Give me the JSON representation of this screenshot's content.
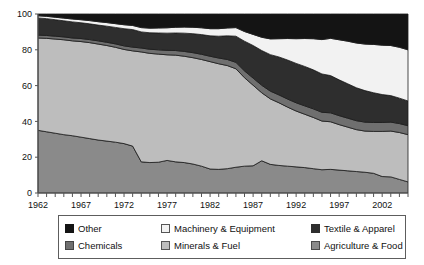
{
  "chart_data": {
    "type": "area",
    "stacked": true,
    "normalized": true,
    "title": "",
    "subtitle": "",
    "xlabel": "",
    "ylabel": "",
    "xlim": [
      1962,
      2005
    ],
    "ylim": [
      0,
      100
    ],
    "grid": false,
    "legend_position": "bottom",
    "y_ticks": [
      0,
      20,
      40,
      60,
      80,
      100
    ],
    "y_tick_labels": [
      "0",
      "20",
      "40",
      "60",
      "80",
      "100"
    ],
    "x_tick_labels": [
      "1962",
      "1967",
      "1972",
      "1977",
      "1982",
      "1987",
      "1992",
      "1997",
      "2002"
    ],
    "x_tick_values": [
      1962,
      1967,
      1972,
      1977,
      1982,
      1987,
      1992,
      1997,
      2002
    ],
    "x_minor_tick_interval": 1,
    "x": [
      1962,
      1963,
      1964,
      1965,
      1966,
      1967,
      1968,
      1969,
      1970,
      1971,
      1972,
      1973,
      1974,
      1975,
      1976,
      1977,
      1978,
      1979,
      1980,
      1981,
      1982,
      1983,
      1984,
      1985,
      1986,
      1987,
      1988,
      1989,
      1990,
      1991,
      1992,
      1993,
      1994,
      1995,
      1996,
      1997,
      1998,
      1999,
      2000,
      2001,
      2002,
      2003,
      2004,
      2005
    ],
    "series": [
      {
        "name": "Agriculture & Food",
        "color": "#8a8a8a",
        "values": [
          35.0,
          34.2,
          33.4,
          32.6,
          32.0,
          31.2,
          30.4,
          29.6,
          29.0,
          28.4,
          27.6,
          26.2,
          17.4,
          17.0,
          17.2,
          18.2,
          17.4,
          17.0,
          16.2,
          15.0,
          13.4,
          13.2,
          13.6,
          14.4,
          15.0,
          15.2,
          18.0,
          16.0,
          15.4,
          15.0,
          14.6,
          14.2,
          13.6,
          13.0,
          13.2,
          12.8,
          12.4,
          12.0,
          11.6,
          11.0,
          9.2,
          9.0,
          7.6,
          6.2
        ]
      },
      {
        "name": "Minerals & Fuel",
        "color": "#bdbdbd",
        "values": [
          51.6,
          52.2,
          52.6,
          53.0,
          53.0,
          53.4,
          53.6,
          53.6,
          53.4,
          53.0,
          52.6,
          53.2,
          61.4,
          61.0,
          60.4,
          59.0,
          59.6,
          59.4,
          59.4,
          59.6,
          60.0,
          59.0,
          57.6,
          55.0,
          49.4,
          45.0,
          38.0,
          36.6,
          35.0,
          33.0,
          31.2,
          29.8,
          28.6,
          27.2,
          26.6,
          25.4,
          24.4,
          23.4,
          23.0,
          23.4,
          25.2,
          25.6,
          26.2,
          26.4
        ]
      },
      {
        "name": "Chemicals",
        "color": "#6f6f6f",
        "values": [
          1.6,
          1.6,
          1.6,
          1.6,
          1.6,
          1.7,
          1.7,
          1.8,
          1.8,
          1.9,
          2.0,
          2.1,
          2.2,
          2.3,
          2.4,
          2.5,
          2.6,
          2.7,
          2.8,
          2.9,
          3.0,
          3.2,
          3.4,
          3.6,
          3.8,
          4.0,
          4.2,
          4.3,
          4.4,
          4.5,
          4.6,
          4.7,
          4.8,
          4.9,
          5.0,
          5.0,
          5.0,
          5.0,
          5.0,
          5.0,
          5.0,
          5.0,
          5.0,
          5.0
        ]
      },
      {
        "name": "Textile & Apparel",
        "color": "#2e2e2e",
        "values": [
          9.6,
          9.4,
          9.2,
          9.0,
          9.0,
          8.8,
          8.8,
          8.8,
          9.0,
          9.2,
          9.6,
          9.8,
          9.0,
          9.2,
          9.4,
          9.6,
          9.8,
          10.2,
          10.6,
          11.0,
          11.4,
          12.2,
          13.2,
          14.6,
          16.6,
          18.2,
          19.4,
          20.4,
          21.2,
          21.8,
          22.0,
          22.0,
          21.8,
          21.4,
          20.8,
          20.0,
          19.2,
          18.4,
          17.6,
          16.6,
          15.6,
          14.8,
          14.2,
          13.8
        ]
      },
      {
        "name": "Machinery & Equipment",
        "color": "#f2f2f2",
        "values": [
          1.2,
          1.3,
          1.4,
          1.5,
          1.6,
          1.7,
          1.8,
          1.9,
          2.0,
          2.1,
          2.2,
          2.3,
          2.4,
          2.6,
          2.8,
          3.0,
          3.2,
          3.4,
          3.6,
          3.8,
          4.0,
          4.2,
          4.4,
          4.8,
          5.4,
          6.2,
          7.4,
          8.8,
          10.2,
          12.0,
          13.8,
          15.6,
          17.4,
          19.2,
          20.8,
          22.4,
          23.8,
          25.0,
          26.0,
          27.0,
          27.6,
          28.0,
          28.4,
          28.6
        ]
      },
      {
        "name": "Other",
        "color": "#141414",
        "values": [
          1.0,
          1.3,
          1.8,
          2.3,
          2.8,
          3.2,
          3.7,
          4.3,
          4.8,
          5.4,
          6.0,
          6.4,
          7.6,
          7.9,
          7.8,
          7.7,
          7.4,
          7.3,
          7.4,
          7.7,
          8.2,
          8.2,
          7.8,
          7.6,
          9.8,
          11.4,
          13.0,
          13.9,
          13.8,
          13.7,
          13.8,
          13.7,
          13.8,
          14.3,
          13.6,
          14.4,
          15.2,
          16.2,
          16.8,
          17.0,
          17.4,
          17.6,
          18.6,
          20.0
        ]
      }
    ]
  },
  "legend": {
    "rows": [
      [
        {
          "label": "Other",
          "color": "#141414",
          "border": "#141414"
        },
        {
          "label": "Machinery & Equipment",
          "color": "#f2f2f2",
          "border": "#555555"
        },
        {
          "label": "Textile & Apparel",
          "color": "#2e2e2e",
          "border": "#2e2e2e"
        }
      ],
      [
        {
          "label": "Chemicals",
          "color": "#6f6f6f",
          "border": "#444444"
        },
        {
          "label": "Minerals & Fuel",
          "color": "#bdbdbd",
          "border": "#555555"
        },
        {
          "label": "Agriculture & Food",
          "color": "#8a8a8a",
          "border": "#4a4a4a"
        }
      ]
    ]
  },
  "axis": {
    "line_color": "#555555",
    "label_color": "#111111"
  }
}
